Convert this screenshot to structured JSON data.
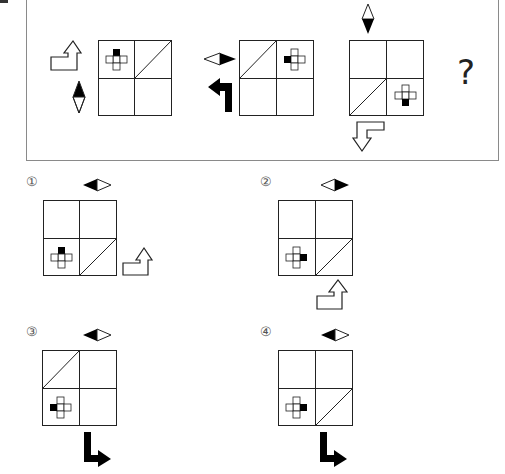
{
  "question": {
    "marker": "question-mark",
    "question_mark": "?",
    "sequence": [
      {
        "id": "seq-1",
        "grid_diagonal_cell": "top-right",
        "cross_cell": "top-left",
        "cross_black_arm": "top",
        "diamond": "vertical-top-black",
        "arrow": "outline-corner-up"
      },
      {
        "id": "seq-2",
        "grid_diagonal_cell": "top-left",
        "cross_cell": "top-right",
        "cross_black_arm": "left",
        "diamond": "horizontal-right-black",
        "arrow": "solid-corner-left"
      },
      {
        "id": "seq-3",
        "grid_diagonal_cell": "bottom-left",
        "cross_cell": "bottom-right",
        "cross_black_arm": "bottom",
        "diamond": "vertical-bottom-black",
        "arrow": "outline-corner-down"
      }
    ]
  },
  "options": [
    {
      "number": "①",
      "grid_diagonal_cell": "bottom-right",
      "cross_cell": "bottom-left",
      "cross_black_arm": "top",
      "diamond": "horizontal-left-black",
      "arrow": "outline-corner-up"
    },
    {
      "number": "②",
      "grid_diagonal_cell": "bottom-right",
      "cross_cell": "bottom-left",
      "cross_black_arm": "right",
      "diamond": "horizontal-right-black",
      "arrow": "outline-corner-up"
    },
    {
      "number": "③",
      "grid_diagonal_cell": "top-left",
      "cross_cell": "bottom-left",
      "cross_black_arm": "left",
      "diamond": "horizontal-left-black",
      "arrow": "solid-corner-right"
    },
    {
      "number": "④",
      "grid_diagonal_cell": "bottom-right",
      "cross_cell": "bottom-left",
      "cross_black_arm": "right",
      "diamond": "horizontal-left-black",
      "arrow": "solid-corner-right"
    }
  ],
  "colors": {
    "line": "#222222",
    "panel_border": "#8a8a8a",
    "fill": "#000000"
  }
}
